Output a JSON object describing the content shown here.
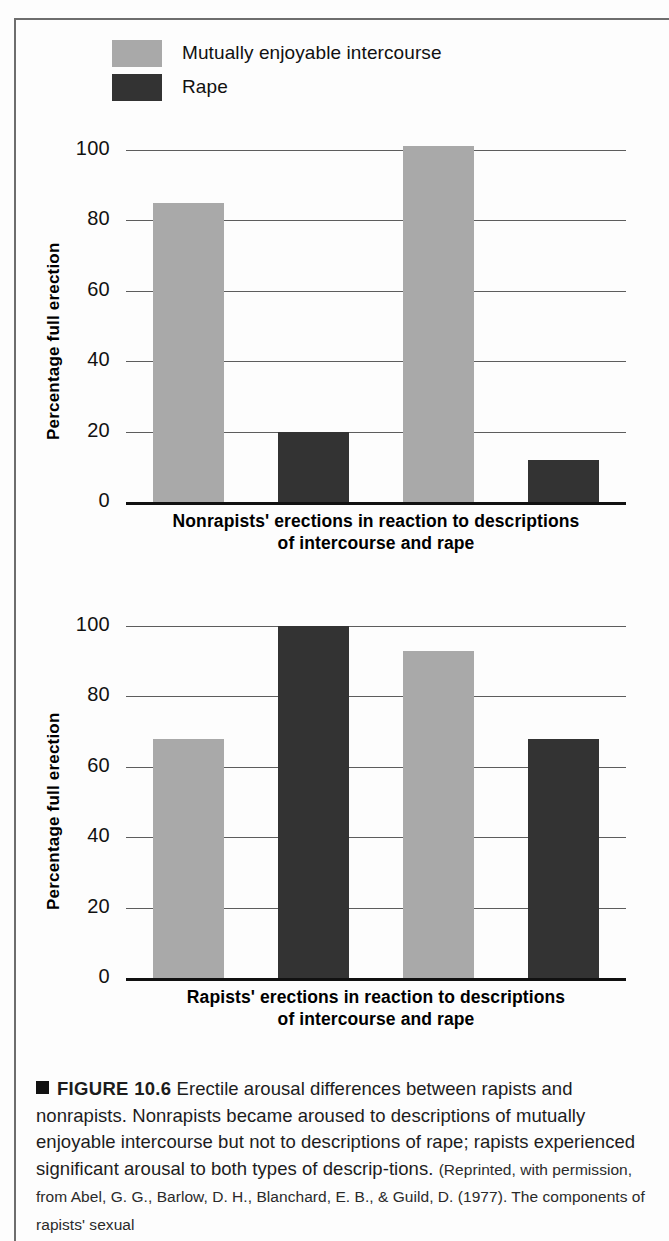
{
  "figure": {
    "caption_marker": "square-bullet",
    "caption_label": "FIGURE 10.6",
    "caption_body": "Erectile arousal differences between rapists and nonrapists. Nonrapists became aroused to descriptions of mutually enjoyable intercourse but not to descriptions of rape; rapists experienced significant arousal to both types of descrip-tions.",
    "caption_source": "(Reprinted, with permission, from Abel, G. G., Barlow, D. H., Blanchard, E. B., & Guild, D. (1977). The components of rapists' sexual"
  },
  "colors": {
    "series_light": "#a9a9a9",
    "series_dark": "#333333",
    "gridline": "#5d5d5d",
    "axis": "#111111",
    "frame": "#6e6e6e"
  },
  "legend": {
    "position": "top-left",
    "items": [
      {
        "label": "Mutually enjoyable intercourse",
        "color": "#a9a9a9"
      },
      {
        "label": "Rape",
        "color": "#333333"
      }
    ]
  },
  "chart_data": [
    {
      "id": "nonrapists",
      "type": "bar",
      "title": "",
      "xlabel": "Nonrapists' erections in reaction to descriptions of intercourse and rape",
      "xlabel_line1": "Nonrapists' erections in reaction to descriptions",
      "xlabel_line2": "of intercourse and rape",
      "ylabel": "Percentage full erection",
      "ylim": [
        0,
        100
      ],
      "yticks": [
        0,
        20,
        40,
        60,
        80,
        100
      ],
      "grid": true,
      "legend_position": "top-left",
      "categories": [
        "Mutually enjoyable intercourse",
        "Rape",
        "Mutually enjoyable intercourse",
        "Rape"
      ],
      "bars": [
        {
          "label": "Mutually enjoyable intercourse",
          "value": 85,
          "color": "#a9a9a9"
        },
        {
          "label": "Rape",
          "value": 20,
          "color": "#333333"
        },
        {
          "label": "Mutually enjoyable intercourse",
          "value": 101,
          "color": "#a9a9a9"
        },
        {
          "label": "Rape",
          "value": 12,
          "color": "#333333"
        }
      ]
    },
    {
      "id": "rapists",
      "type": "bar",
      "title": "",
      "xlabel": "Rapists' erections in reaction to descriptions of intercourse and rape",
      "xlabel_line1": "Rapists' erections in reaction to descriptions",
      "xlabel_line2": "of intercourse and rape",
      "ylabel": "Percentage full erection",
      "ylim": [
        0,
        100
      ],
      "yticks": [
        0,
        20,
        40,
        60,
        80,
        100
      ],
      "grid": true,
      "legend_position": "top-left",
      "categories": [
        "Mutually enjoyable intercourse",
        "Rape",
        "Mutually enjoyable intercourse",
        "Rape"
      ],
      "bars": [
        {
          "label": "Mutually enjoyable intercourse",
          "value": 68,
          "color": "#a9a9a9"
        },
        {
          "label": "Rape",
          "value": 100,
          "color": "#333333"
        },
        {
          "label": "Mutually enjoyable intercourse",
          "value": 93,
          "color": "#a9a9a9"
        },
        {
          "label": "Rape",
          "value": 68,
          "color": "#333333"
        }
      ]
    }
  ]
}
